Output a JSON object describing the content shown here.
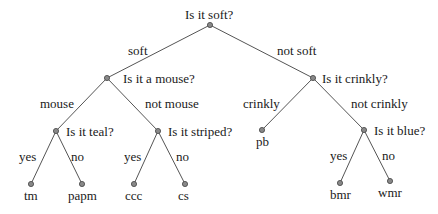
{
  "diagram": {
    "type": "decision-tree",
    "nodes": [
      {
        "id": "root",
        "label": "Is it soft?",
        "x": 210,
        "y": 25,
        "lx": 185,
        "ly": 19
      },
      {
        "id": "q_mouse",
        "label": "Is it a mouse?",
        "x": 107,
        "y": 78,
        "lx": 123,
        "ly": 83
      },
      {
        "id": "q_crinkly",
        "label": "Is it crinkly?",
        "x": 313,
        "y": 78,
        "lx": 322,
        "ly": 83
      },
      {
        "id": "q_teal",
        "label": "Is it teal?",
        "x": 56,
        "y": 131,
        "lx": 66,
        "ly": 136
      },
      {
        "id": "q_striped",
        "label": "Is it striped?",
        "x": 158,
        "y": 131,
        "lx": 168,
        "ly": 136
      },
      {
        "id": "q_blue",
        "label": "Is it blue?",
        "x": 364,
        "y": 130,
        "lx": 374,
        "ly": 135
      },
      {
        "id": "tm",
        "label": "tm",
        "x": 31,
        "y": 184,
        "lx": 24,
        "ly": 200
      },
      {
        "id": "papm",
        "label": "papm",
        "x": 82,
        "y": 184,
        "lx": 68,
        "ly": 200
      },
      {
        "id": "ccc",
        "label": "ccc",
        "x": 134,
        "y": 184,
        "lx": 125,
        "ly": 200
      },
      {
        "id": "cs",
        "label": "cs",
        "x": 185,
        "y": 184,
        "lx": 178,
        "ly": 200
      },
      {
        "id": "pb",
        "label": "pb",
        "x": 262,
        "y": 130,
        "lx": 256,
        "ly": 146
      },
      {
        "id": "bmr",
        "label": "bmr",
        "x": 340,
        "y": 183,
        "lx": 330,
        "ly": 199
      },
      {
        "id": "wmr",
        "label": "wmr",
        "x": 390,
        "y": 181,
        "lx": 378,
        "ly": 197
      }
    ],
    "edges": [
      {
        "from": "root",
        "to": "q_mouse",
        "label": "soft",
        "lx": 128,
        "ly": 55
      },
      {
        "from": "root",
        "to": "q_crinkly",
        "label": "not soft",
        "lx": 277,
        "ly": 55
      },
      {
        "from": "q_mouse",
        "to": "q_teal",
        "label": "mouse",
        "lx": 40,
        "ly": 108
      },
      {
        "from": "q_mouse",
        "to": "q_striped",
        "label": "not mouse",
        "lx": 145,
        "ly": 108
      },
      {
        "from": "q_crinkly",
        "to": "pb",
        "label": "crinkly",
        "lx": 243,
        "ly": 108
      },
      {
        "from": "q_crinkly",
        "to": "q_blue",
        "label": "not crinkly",
        "lx": 351,
        "ly": 108
      },
      {
        "from": "q_teal",
        "to": "tm",
        "label": "yes",
        "lx": 19,
        "ly": 161
      },
      {
        "from": "q_teal",
        "to": "papm",
        "label": "no",
        "lx": 71,
        "ly": 161
      },
      {
        "from": "q_striped",
        "to": "ccc",
        "label": "yes",
        "lx": 124,
        "ly": 161
      },
      {
        "from": "q_striped",
        "to": "cs",
        "label": "no",
        "lx": 176,
        "ly": 161
      },
      {
        "from": "q_blue",
        "to": "bmr",
        "label": "yes",
        "lx": 330,
        "ly": 160
      },
      {
        "from": "q_blue",
        "to": "wmr",
        "label": "no",
        "lx": 382,
        "ly": 160
      }
    ]
  }
}
